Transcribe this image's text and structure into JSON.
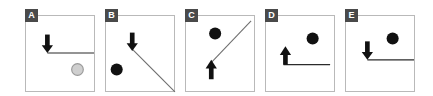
{
  "figure": {
    "title": "",
    "background": "#ffffff",
    "panel_border_color": "#b9b9b9",
    "badge_background": "#4a4a4a",
    "badge_text_color": "#ffffff",
    "line_color": "#2b2b2b",
    "arrow_color": "#111111",
    "ball_black": "#111111",
    "ball_gray_fill": "#cfcfcf",
    "ball_gray_stroke": "#9a9a9a"
  },
  "panels": [
    {
      "label": "A",
      "name": "panel-a",
      "surface": {
        "type": "horizontal-line",
        "x1": 22,
        "y1": 38,
        "x2": 70,
        "y2": 38
      },
      "arrow": {
        "direction": "down",
        "name": "down-arrow",
        "x": 22,
        "tip_y": 38,
        "tail_y": 19
      },
      "ball": {
        "name": "ball-gray",
        "fill": "gray",
        "cx": 53,
        "cy": 55,
        "r": 6
      }
    },
    {
      "label": "B",
      "name": "panel-b",
      "surface": {
        "type": "diagonal-line",
        "x1": 27,
        "y1": 34,
        "x2": 69,
        "y2": 76
      },
      "arrow": {
        "direction": "down",
        "name": "down-arrow",
        "x": 27,
        "tip_y": 36,
        "tail_y": 17
      },
      "ball": {
        "name": "ball-black",
        "fill": "black",
        "cx": 11,
        "cy": 55,
        "r": 6
      }
    },
    {
      "label": "C",
      "name": "panel-c",
      "surface": {
        "type": "diagonal-line",
        "x1": 26,
        "y1": 48,
        "x2": 67,
        "y2": 6
      },
      "arrow": {
        "direction": "up",
        "name": "up-arrow",
        "x": 26,
        "tip_y": 45,
        "tail_y": 64
      },
      "ball": {
        "name": "ball-black",
        "fill": "black",
        "cx": 30,
        "cy": 18,
        "r": 6
      }
    },
    {
      "label": "D",
      "name": "panel-d",
      "surface": {
        "type": "horizontal-line",
        "x1": 20,
        "y1": 50,
        "x2": 66,
        "y2": 50
      },
      "arrow": {
        "direction": "up",
        "name": "up-arrow",
        "x": 20,
        "tip_y": 31,
        "tail_y": 50
      },
      "ball": {
        "name": "ball-black",
        "fill": "black",
        "cx": 48,
        "cy": 23,
        "r": 6
      }
    },
    {
      "label": "E",
      "name": "panel-e",
      "surface": {
        "type": "horizontal-line",
        "x1": 22,
        "y1": 45,
        "x2": 69,
        "y2": 45
      },
      "arrow": {
        "direction": "down",
        "name": "down-arrow",
        "x": 22,
        "tip_y": 45,
        "tail_y": 26
      },
      "ball": {
        "name": "ball-black",
        "fill": "black",
        "cx": 48,
        "cy": 23,
        "r": 6
      }
    }
  ]
}
